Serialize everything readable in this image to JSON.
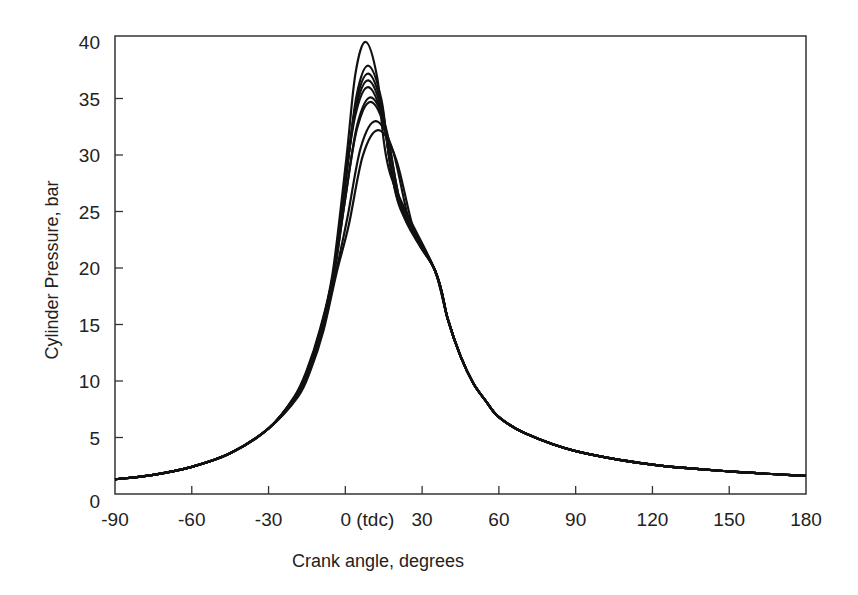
{
  "chart_data": {
    "type": "line",
    "title": "",
    "xlabel": "Crank angle, degrees",
    "ylabel": "Cylinder Pressure, bar",
    "xlim": [
      -90,
      180
    ],
    "ylim": [
      0,
      40.5
    ],
    "x_ticks": [
      -90,
      -60,
      -30,
      0,
      30,
      60,
      90,
      120,
      150,
      180
    ],
    "x_tick_labels": [
      "-90",
      "-60",
      "-30",
      "0 (tdc)",
      "30",
      "60",
      "90",
      "120",
      "150",
      "180"
    ],
    "y_ticks": [
      0,
      5,
      10,
      15,
      20,
      25,
      30,
      35,
      40
    ],
    "y_tick_labels": [
      "0",
      "5",
      "10",
      "15",
      "20",
      "25",
      "30",
      "35",
      "40"
    ],
    "grid": false,
    "legend": null,
    "common_curve": {
      "x": [
        -90,
        -75,
        -60,
        -45,
        -30,
        -20,
        -15,
        -10,
        -5,
        35,
        40,
        45,
        50,
        55,
        60,
        70,
        90,
        120,
        150,
        180
      ],
      "y": [
        1.3,
        1.7,
        2.4,
        3.6,
        5.8,
        8.6,
        11.0,
        14.5,
        19.5,
        19.8,
        15.5,
        12.2,
        9.8,
        8.2,
        6.8,
        5.4,
        3.8,
        2.6,
        2.0,
        1.6
      ]
    },
    "series": [
      {
        "name": "cycle 1",
        "peak_angle": 8,
        "peak_pressure": 40.0
      },
      {
        "name": "cycle 2",
        "peak_angle": 9,
        "peak_pressure": 37.9
      },
      {
        "name": "cycle 3",
        "peak_angle": 9,
        "peak_pressure": 37.2
      },
      {
        "name": "cycle 4",
        "peak_angle": 9,
        "peak_pressure": 36.6
      },
      {
        "name": "cycle 5",
        "peak_angle": 9,
        "peak_pressure": 36.0
      },
      {
        "name": "cycle 6",
        "peak_angle": 10,
        "peak_pressure": 35.1
      },
      {
        "name": "cycle 7",
        "peak_angle": 10,
        "peak_pressure": 34.7
      },
      {
        "name": "cycle 8",
        "peak_angle": 12,
        "peak_pressure": 33.0
      },
      {
        "name": "cycle 9",
        "peak_angle": 13,
        "peak_pressure": 32.2
      }
    ]
  }
}
